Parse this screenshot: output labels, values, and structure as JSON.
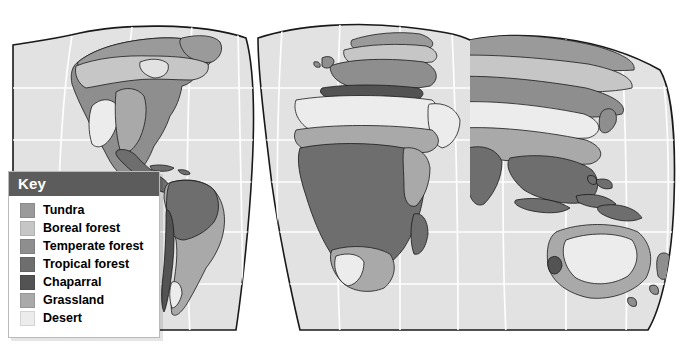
{
  "figure": {
    "type": "thematic-world-map",
    "projection": "interrupted-goode-homolosine",
    "background_color": "#ffffff",
    "ocean_color": "#e2e2e2",
    "graticule_color": "#ffffff",
    "coastline_color": "#1a1a1a"
  },
  "legend": {
    "title": "Key",
    "title_color": "#ffffff",
    "header_background": "#5c5c5c",
    "box_background": "#ffffff",
    "items": [
      {
        "label": "Tundra",
        "color": "#9a9a9a"
      },
      {
        "label": "Boreal forest",
        "color": "#c6c6c6"
      },
      {
        "label": "Temperate forest",
        "color": "#8e8e8e"
      },
      {
        "label": "Tropical forest",
        "color": "#6e6e6e"
      },
      {
        "label": "Chaparral",
        "color": "#535353"
      },
      {
        "label": "Grassland",
        "color": "#a9a9a9"
      },
      {
        "label": "Desert",
        "color": "#ececec"
      }
    ]
  },
  "regions": [
    {
      "name": "north-america-tundra",
      "biome": "Tundra"
    },
    {
      "name": "north-america-boreal-forest",
      "biome": "Boreal forest"
    },
    {
      "name": "north-america-temperate-forest",
      "biome": "Temperate forest"
    },
    {
      "name": "north-america-grassland",
      "biome": "Grassland"
    },
    {
      "name": "north-america-desert",
      "biome": "Desert"
    },
    {
      "name": "central-america-tropical-forest",
      "biome": "Tropical forest"
    },
    {
      "name": "south-america-tropical-forest",
      "biome": "Tropical forest"
    },
    {
      "name": "south-america-grassland",
      "biome": "Grassland"
    },
    {
      "name": "south-america-chaparral",
      "biome": "Chaparral"
    },
    {
      "name": "europe-temperate-forest",
      "biome": "Temperate forest"
    },
    {
      "name": "europe-boreal-forest",
      "biome": "Boreal forest"
    },
    {
      "name": "eurasia-tundra",
      "biome": "Tundra"
    },
    {
      "name": "siberia-boreal-forest",
      "biome": "Boreal forest"
    },
    {
      "name": "central-asia-desert",
      "biome": "Desert"
    },
    {
      "name": "central-asia-grassland",
      "biome": "Grassland"
    },
    {
      "name": "south-asia-tropical-forest",
      "biome": "Tropical forest"
    },
    {
      "name": "southeast-asia-tropical-forest",
      "biome": "Tropical forest"
    },
    {
      "name": "arabia-desert",
      "biome": "Desert"
    },
    {
      "name": "sahara-desert",
      "biome": "Desert"
    },
    {
      "name": "sahel-grassland",
      "biome": "Grassland"
    },
    {
      "name": "congo-tropical-forest",
      "biome": "Tropical forest"
    },
    {
      "name": "kalahari-desert",
      "biome": "Desert"
    },
    {
      "name": "southern-africa-grassland",
      "biome": "Grassland"
    },
    {
      "name": "madagascar-tropical-forest",
      "biome": "Tropical forest"
    },
    {
      "name": "australia-desert",
      "biome": "Desert"
    },
    {
      "name": "australia-grassland",
      "biome": "Grassland"
    },
    {
      "name": "australia-chaparral",
      "biome": "Chaparral"
    },
    {
      "name": "new-guinea-tropical-forest",
      "biome": "Tropical forest"
    },
    {
      "name": "new-zealand-temperate-forest",
      "biome": "Temperate forest"
    },
    {
      "name": "greenland-tundra",
      "biome": "Tundra"
    }
  ]
}
